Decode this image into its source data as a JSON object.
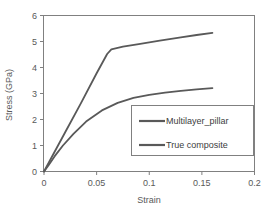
{
  "chart_data": {
    "type": "line",
    "title": "",
    "xlabel": "Strain",
    "ylabel": "Stress (GPa)",
    "xlim": [
      0,
      0.2
    ],
    "ylim": [
      0,
      6
    ],
    "xticks": [
      "0",
      "0.05",
      "0.1",
      "0.15",
      "0.2"
    ],
    "xtick_values": [
      0,
      0.05,
      0.1,
      0.15,
      0.2
    ],
    "yticks": [
      "0",
      "1",
      "2",
      "3",
      "4",
      "5",
      "6"
    ],
    "ytick_values": [
      0,
      1,
      2,
      3,
      4,
      5,
      6
    ],
    "grid": false,
    "legend_position": "lower-right-inside",
    "series": [
      {
        "name": "Multilayer_pillar",
        "color": "#595959",
        "x": [
          0,
          0.004,
          0.01,
          0.018,
          0.028,
          0.04,
          0.055,
          0.07,
          0.085,
          0.1,
          0.115,
          0.13,
          0.145,
          0.16
        ],
        "y": [
          0,
          0.22,
          0.58,
          1.0,
          1.45,
          1.92,
          2.35,
          2.64,
          2.83,
          2.95,
          3.03,
          3.1,
          3.16,
          3.21
        ]
      },
      {
        "name": "True composite",
        "color": "#595959",
        "x": [
          0,
          0.006,
          0.02,
          0.035,
          0.05,
          0.06,
          0.064,
          0.075,
          0.09,
          0.11,
          0.13,
          0.145,
          0.16
        ],
        "y": [
          0,
          0.45,
          1.5,
          2.62,
          3.78,
          4.52,
          4.7,
          4.8,
          4.9,
          5.03,
          5.16,
          5.25,
          5.33
        ]
      }
    ]
  },
  "legend": {
    "items": [
      {
        "label": "Multilayer_pillar",
        "color": "#595959"
      },
      {
        "label": "True composite",
        "color": "#595959"
      }
    ]
  },
  "axes": {
    "x_title": "Strain",
    "y_title": "Stress (GPa)"
  }
}
